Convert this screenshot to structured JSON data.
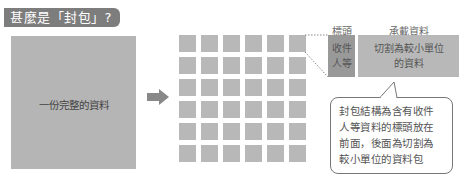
{
  "title": "甚麼是「封包」?",
  "whole_data": {
    "label": "一份完整的資料"
  },
  "arrow": {
    "icon": "right-arrow-icon"
  },
  "grid": {
    "rows": 6,
    "cols": 6,
    "cells": 36
  },
  "packet": {
    "header_title": "標頭",
    "payload_title": "承載資料",
    "header_text": "收件人等",
    "header_lines": [
      "收件",
      "人等"
    ],
    "payload_lines": [
      "切割為較小單位",
      "的資料"
    ]
  },
  "callout": {
    "lines": [
      "封包結構為含有收件",
      "人等資料的標頭放在",
      "前面，後面為切割為",
      "較小單位的資料包"
    ]
  },
  "colors": {
    "badge": "#7d7d7d",
    "block": "#b5b5b5",
    "header_block": "#999999",
    "arrow": "#888888"
  }
}
